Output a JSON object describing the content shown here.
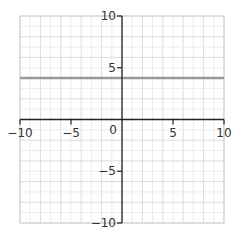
{
  "chart_data": {
    "type": "line",
    "title": "",
    "xlabel": "",
    "ylabel": "",
    "xlim": [
      -10,
      10
    ],
    "ylim": [
      -10,
      10
    ],
    "grid": true,
    "grid_step": 1,
    "x_ticks": [
      -10,
      -5,
      0,
      5,
      10
    ],
    "y_ticks": [
      10,
      5,
      -5,
      -10
    ],
    "x_tick_labels": [
      "−10",
      "−5",
      "0",
      "5",
      "10"
    ],
    "y_tick_labels": [
      "10",
      "5",
      "−5",
      "−10"
    ],
    "series": [
      {
        "name": "horizontal line",
        "equation": "y = 4",
        "x": [
          -10,
          10
        ],
        "y": [
          4,
          4
        ],
        "color": "#999999"
      }
    ],
    "colors": {
      "axis": "#222222",
      "grid": "#e3e3e3",
      "line": "#999999"
    }
  }
}
